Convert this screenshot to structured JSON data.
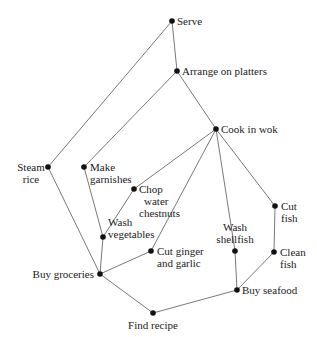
{
  "caption_fragment": "",
  "nodes": [
    {
      "id": "serve",
      "lines": [
        "Serve"
      ]
    },
    {
      "id": "arrange",
      "lines": [
        "Arrange on platters"
      ]
    },
    {
      "id": "cook",
      "lines": [
        "Cook in wok"
      ]
    },
    {
      "id": "steam",
      "lines": [
        "Steam",
        "rice"
      ]
    },
    {
      "id": "garnish",
      "lines": [
        "Make",
        "garnishes"
      ]
    },
    {
      "id": "chop",
      "lines": [
        "Chop",
        "water",
        "chestnuts"
      ]
    },
    {
      "id": "washveg",
      "lines": [
        "Wash",
        "vegetables"
      ]
    },
    {
      "id": "ginger",
      "lines": [
        "Cut ginger",
        "and garlic"
      ]
    },
    {
      "id": "shellfish",
      "lines": [
        "Wash",
        "shellfish"
      ]
    },
    {
      "id": "cutfish",
      "lines": [
        "Cut",
        "fish"
      ]
    },
    {
      "id": "cleanfish",
      "lines": [
        "Clean",
        "fish"
      ]
    },
    {
      "id": "groceries",
      "lines": [
        "Buy groceries"
      ]
    },
    {
      "id": "seafood",
      "lines": [
        "Buy seafood"
      ]
    },
    {
      "id": "recipe",
      "lines": [
        "Find recipe"
      ]
    }
  ],
  "edges": [
    [
      "recipe",
      "groceries"
    ],
    [
      "recipe",
      "seafood"
    ],
    [
      "groceries",
      "steam"
    ],
    [
      "groceries",
      "washveg"
    ],
    [
      "groceries",
      "ginger"
    ],
    [
      "washveg",
      "garnish"
    ],
    [
      "washveg",
      "chop"
    ],
    [
      "seafood",
      "shellfish"
    ],
    [
      "seafood",
      "cleanfish"
    ],
    [
      "cleanfish",
      "cutfish"
    ],
    [
      "chop",
      "cook"
    ],
    [
      "ginger",
      "cook"
    ],
    [
      "shellfish",
      "cook"
    ],
    [
      "cutfish",
      "cook"
    ],
    [
      "cook",
      "arrange"
    ],
    [
      "garnish",
      "arrange"
    ],
    [
      "arrange",
      "serve"
    ],
    [
      "steam",
      "serve"
    ]
  ]
}
